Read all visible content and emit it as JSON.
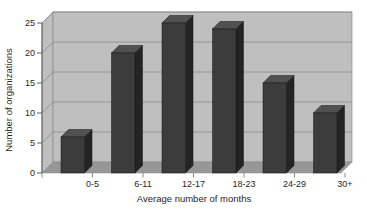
{
  "chart_data": {
    "type": "bar",
    "variant": "3d-column",
    "title": "",
    "xlabel": "Average number of months",
    "ylabel": "Number of organizations",
    "categories": [
      "0-5",
      "6-11",
      "12-17",
      "18-23",
      "24-29",
      "30+"
    ],
    "values": [
      6,
      20,
      25,
      24,
      15,
      10
    ],
    "ylim": [
      0,
      25
    ],
    "ytick_step": 5,
    "ytick_labels": [
      "0",
      "5",
      "10",
      "15",
      "20",
      "25"
    ],
    "grid": true,
    "legend": "none",
    "colors": {
      "bar_front": "#3c3c3c",
      "bar_top": "#515151",
      "bar_side": "#242424",
      "bar_outline": "#161616",
      "wall": "#bfbfbf",
      "floor": "#979797",
      "gridline": "#8b8b8b",
      "axis_line": "#5f5f5f",
      "text": "#1f1f1f",
      "background": "#ffffff"
    }
  }
}
